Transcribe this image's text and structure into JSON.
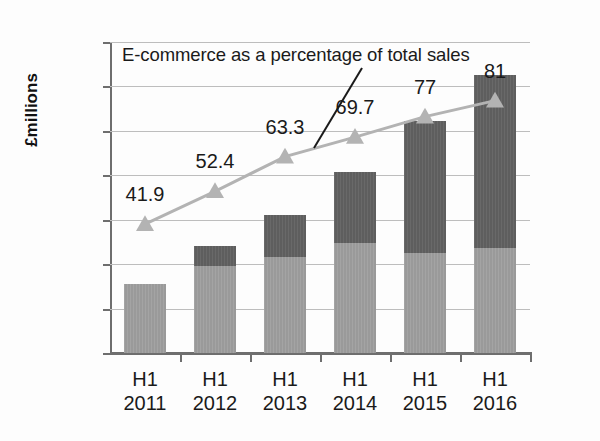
{
  "chart_data": {
    "type": "bar",
    "title": "",
    "subtitle": "",
    "xlabel": "",
    "ylabel": "£millions",
    "ylim": [
      0,
      350
    ],
    "yticks": [
      0,
      50,
      100,
      150,
      200,
      250,
      300,
      350
    ],
    "ytick_labels": [
      "0",
      "50",
      "100",
      "150",
      "200",
      "250",
      "300",
      "350"
    ],
    "grid": true,
    "legend": "none",
    "categories": [
      "H1 2011",
      "H1 2012",
      "H1 2013",
      "H1 2014",
      "H1 2015",
      "H1 2016"
    ],
    "category_lines": [
      [
        "H1",
        "2011"
      ],
      [
        "H1",
        "2012"
      ],
      [
        "H1",
        "2013"
      ],
      [
        "H1",
        "2014"
      ],
      [
        "H1",
        "2015"
      ],
      [
        "H1",
        "2016"
      ]
    ],
    "stacked": true,
    "series": [
      {
        "name": "lower-segment",
        "color": "#9a9a9a",
        "values": [
          78,
          98,
          108,
          124,
          112,
          118
        ]
      },
      {
        "name": "upper-segment",
        "color": "#5e5e5e",
        "values": [
          0,
          23,
          47,
          80,
          149,
          195
        ]
      }
    ],
    "totals": [
      78,
      121,
      155,
      204,
      261,
      313
    ],
    "overlay_line": {
      "name": "E-commerce as a percentage of total sales",
      "color": "#b3b3b3",
      "marker": "triangle",
      "axis": "secondary-implied",
      "values": [
        41.9,
        52.4,
        63.3,
        69.7,
        77,
        81
      ],
      "plotted_positions": [
        145,
        182,
        221,
        243,
        266,
        284
      ],
      "labels": [
        "41.9",
        "52.4",
        "63.3",
        "69.7",
        "77",
        "81"
      ]
    },
    "annotation": {
      "text": "E-commerce as a percentage of total sales",
      "leader_line": true
    }
  },
  "axis": {
    "y_title": "£millions",
    "y_tick_labels": [
      "350",
      "300",
      "250",
      "200",
      "150",
      "100",
      "50",
      "0"
    ]
  },
  "annotation": {
    "callout_text": "E-commerce as a percentage of total sales"
  },
  "x_categories": [
    {
      "line1": "H1",
      "line2": "2011"
    },
    {
      "line1": "H1",
      "line2": "2012"
    },
    {
      "line1": "H1",
      "line2": "2013"
    },
    {
      "line1": "H1",
      "line2": "2014"
    },
    {
      "line1": "H1",
      "line2": "2015"
    },
    {
      "line1": "H1",
      "line2": "2016"
    }
  ],
  "pct_labels": [
    "41.9",
    "52.4",
    "63.3",
    "69.7",
    "77",
    "81"
  ],
  "colors": {
    "bar_lower": "#9a9a9a",
    "bar_upper": "#5e5e5e",
    "line": "#b3b3b3",
    "grid": "#bdbdbd",
    "axis": "#6e6e6e",
    "text": "#1a1a1a"
  }
}
